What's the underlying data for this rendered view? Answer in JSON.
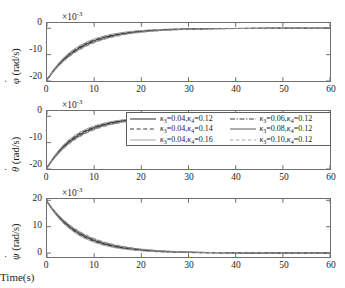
{
  "figure": {
    "xlabel": "Time(s)",
    "exponent_label": "×10",
    "exponent_value": "-3"
  },
  "chart_data": {
    "type": "line",
    "title": "",
    "xlabel": "Time(s)",
    "xlim": [
      0,
      60
    ],
    "xticks": [
      0,
      10,
      20,
      30,
      40,
      50,
      60
    ],
    "xticklabels": [
      "0",
      "10",
      "20",
      "30",
      "40",
      "50",
      "60"
    ],
    "grid": false,
    "legend_position": "middle-subplot-right",
    "units_multiplier": 0.001,
    "legend": [
      {
        "label": "κ3=0.04,κ4=0.12",
        "kappa3": 0.04,
        "kappa4": 0.12,
        "style": "solid",
        "color": "#3a3a3a"
      },
      {
        "label": "κ3=0.04,κ4=0.14",
        "kappa3": 0.04,
        "kappa4": 0.14,
        "style": "dashed",
        "color": "#3a3a3a"
      },
      {
        "label": "κ3=0.04,κ4=0.16",
        "kappa3": 0.04,
        "kappa4": 0.16,
        "style": "solid",
        "color": "#9a9a9a"
      },
      {
        "label": "κ3=0.06,κ4=0.12",
        "kappa3": 0.06,
        "kappa4": 0.12,
        "style": "dashdot",
        "color": "#3a3a3a"
      },
      {
        "label": "κ3=0.08,κ4=0.12",
        "kappa3": 0.08,
        "kappa4": 0.12,
        "style": "solid",
        "color": "#6e6e6e"
      },
      {
        "label": "κ3=0.10,κ4=0.12",
        "kappa3": 0.1,
        "kappa4": 0.12,
        "style": "dashed",
        "color": "#9a9a9a"
      }
    ],
    "subplots": [
      {
        "name": "phi-dot",
        "ylabel": "φ̇ (rad/s)",
        "ylabel_symbol": "φ",
        "ylabel_unit": "(rad/s)",
        "ylim": [
          -20,
          2
        ],
        "yticks": [
          0,
          -10,
          -20
        ],
        "yticklabels": [
          "0",
          "-10",
          "-20"
        ],
        "start_value": -19.6,
        "end_value": 0,
        "series": [
          {
            "name": "κ3=0.04,κ4=0.12",
            "tau": 7.0,
            "y0": -19.6
          },
          {
            "name": "κ3=0.04,κ4=0.14",
            "tau": 6.7,
            "y0": -19.6
          },
          {
            "name": "κ3=0.04,κ4=0.16",
            "tau": 6.4,
            "y0": -19.6
          },
          {
            "name": "κ3=0.06,κ4=0.12",
            "tau": 7.3,
            "y0": -19.6
          },
          {
            "name": "κ3=0.08,κ4=0.12",
            "tau": 7.6,
            "y0": -19.6
          },
          {
            "name": "κ3=0.10,κ4=0.12",
            "tau": 7.9,
            "y0": -19.6
          }
        ]
      },
      {
        "name": "theta-dot",
        "ylabel": "θ̇ (rad/s)",
        "ylabel_symbol": "θ",
        "ylabel_unit": "(rad/s)",
        "ylim": [
          -20,
          2
        ],
        "yticks": [
          0,
          -10,
          -20
        ],
        "yticklabels": [
          "0",
          "-10",
          "-20"
        ],
        "start_value": -19.6,
        "end_value": 0,
        "series": [
          {
            "name": "κ3=0.04,κ4=0.12",
            "tau": 6.6,
            "y0": -19.6
          },
          {
            "name": "κ3=0.04,κ4=0.14",
            "tau": 6.3,
            "y0": -19.6
          },
          {
            "name": "κ3=0.04,κ4=0.16",
            "tau": 6.0,
            "y0": -19.6
          },
          {
            "name": "κ3=0.06,κ4=0.12",
            "tau": 6.9,
            "y0": -19.6
          },
          {
            "name": "κ3=0.08,κ4=0.12",
            "tau": 7.2,
            "y0": -19.6
          },
          {
            "name": "κ3=0.10,κ4=0.12",
            "tau": 7.5,
            "y0": -19.6
          }
        ]
      },
      {
        "name": "psi-dot",
        "ylabel": "ψ̇ (rad/s)",
        "ylabel_symbol": "ψ",
        "ylabel_unit": "(rad/s)",
        "ylim": [
          -1.5,
          20.5
        ],
        "yticks": [
          20,
          10,
          0
        ],
        "yticklabels": [
          "20",
          "10",
          "0"
        ],
        "start_value": 19.6,
        "end_value": 0,
        "series": [
          {
            "name": "κ3=0.04,κ4=0.12",
            "tau": 7.0,
            "y0": 19.6
          },
          {
            "name": "κ3=0.04,κ4=0.14",
            "tau": 6.7,
            "y0": 19.6
          },
          {
            "name": "κ3=0.04,κ4=0.16",
            "tau": 6.4,
            "y0": 19.6
          },
          {
            "name": "κ3=0.06,κ4=0.12",
            "tau": 7.3,
            "y0": 19.6
          },
          {
            "name": "κ3=0.08,κ4=0.12",
            "tau": 7.6,
            "y0": 19.6
          },
          {
            "name": "κ3=0.10,κ4=0.12",
            "tau": 7.9,
            "y0": 19.6
          }
        ]
      }
    ]
  }
}
